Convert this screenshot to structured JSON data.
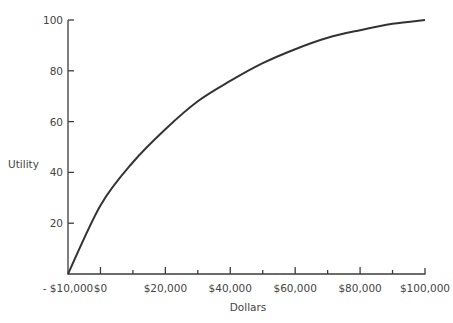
{
  "chart_data": {
    "type": "line",
    "title": "",
    "xlabel": "Dollars",
    "ylabel": "Utility",
    "xlim": [
      -10000,
      100000
    ],
    "ylim": [
      0,
      100
    ],
    "grid": false,
    "legend": null,
    "x_ticks": [
      -10000,
      0,
      20000,
      40000,
      60000,
      80000,
      100000
    ],
    "x_tick_labels": [
      "- $10,000",
      "$0",
      "$20,000",
      "$40,000",
      "$60,000",
      "$80,000",
      "$100,000"
    ],
    "x_minor_ticks": [
      10000,
      30000,
      50000,
      70000,
      90000
    ],
    "y_ticks": [
      20,
      40,
      60,
      80,
      100
    ],
    "y_tick_labels": [
      "20",
      "40",
      "60",
      "80",
      "100"
    ],
    "series": [
      {
        "name": "Utility curve",
        "x": [
          -10000,
          0,
          10000,
          20000,
          30000,
          40000,
          50000,
          60000,
          70000,
          80000,
          90000,
          100000
        ],
        "y": [
          0,
          27,
          44,
          57,
          68,
          76,
          83,
          88.5,
          93,
          96,
          98.5,
          100
        ]
      }
    ]
  }
}
